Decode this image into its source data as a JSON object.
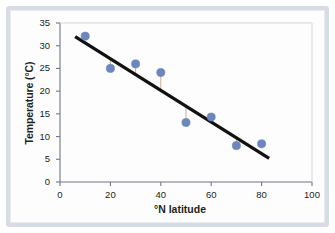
{
  "chart_data": {
    "type": "scatter",
    "title": "",
    "xlabel": "°N latitude",
    "ylabel": "Temperature (°C)",
    "xlim": [
      0,
      100
    ],
    "ylim": [
      0,
      35
    ],
    "xticks": [
      "0",
      "20",
      "40",
      "60",
      "80",
      "100"
    ],
    "xtick_values": [
      0,
      20,
      40,
      60,
      80,
      100
    ],
    "yticks": [
      "0",
      "5",
      "10",
      "15",
      "20",
      "25",
      "30",
      "35"
    ],
    "ytick_values": [
      0,
      5,
      10,
      15,
      20,
      25,
      30,
      35
    ],
    "grid": false,
    "legend": null,
    "x": [
      10,
      20,
      30,
      40,
      50,
      60,
      70,
      80
    ],
    "y": [
      32.1,
      25.0,
      26.0,
      24.1,
      13.1,
      14.3,
      8.0,
      8.4
    ],
    "series": [
      {
        "name": "Temperature vs latitude",
        "marker": "circle",
        "marker_color": "#6b87bd",
        "marker_size": 7,
        "points": [
          {
            "x": 10,
            "y": 32.1
          },
          {
            "x": 20,
            "y": 25.0
          },
          {
            "x": 30,
            "y": 26.0
          },
          {
            "x": 40,
            "y": 24.1
          },
          {
            "x": 50,
            "y": 13.1
          },
          {
            "x": 60,
            "y": 14.3
          },
          {
            "x": 70,
            "y": 8.0
          },
          {
            "x": 80,
            "y": 8.4
          }
        ]
      }
    ],
    "trendline": {
      "type": "linear-fit",
      "color": "#111111",
      "width": 3.2,
      "x_start": 6,
      "y_start": 32.0,
      "x_end": 83,
      "y_end": 5.2
    },
    "residual_lines": {
      "color": "#c9a87c",
      "width": 0.9,
      "description": "thin vertical segments connecting points to the fitted line",
      "segments": [
        {
          "x": 20,
          "y_point": 25.0,
          "y_line": 27.1
        },
        {
          "x": 30,
          "y_point": 26.0,
          "y_line": 23.6
        },
        {
          "x": 40,
          "y_point": 24.1,
          "y_line": 20.1
        },
        {
          "x": 50,
          "y_point": 13.1,
          "y_line": 16.6
        },
        {
          "x": 70,
          "y_point": 8.0,
          "y_line": 9.6
        }
      ]
    }
  },
  "axes": {
    "y_title": "Temperature (°C)",
    "x_title": "°N latitude"
  },
  "colors": {
    "marker": "#6b87bd",
    "trendline": "#111111",
    "residual": "#c9a87c",
    "axis": "#6f7884",
    "frame": "#d8dde5",
    "text": "#231f20"
  }
}
